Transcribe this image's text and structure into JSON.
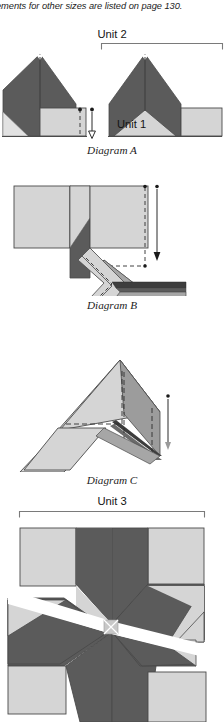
{
  "page": {
    "intro_text": "ements for other sizes are listed on page 130.",
    "background_color": "#ffffff"
  },
  "palette": {
    "dark_gray": "#5b5b5b",
    "medium_gray": "#a6a6a6",
    "light_gray": "#d5d5d5",
    "pale_gray": "#e2e2e2",
    "white": "#ffffff",
    "outline": "#4a4a4a",
    "rule": "#7a7a7a",
    "text": "#1c1c1c"
  },
  "labels": {
    "unit_1": "Unit 1",
    "unit_2": "Unit 2",
    "unit_3": "Unit 3"
  },
  "captions": {
    "diagram_a": "Diagram A",
    "diagram_b": "Diagram B",
    "diagram_c": "Diagram C"
  },
  "figures": [
    {
      "name": "diagram-a",
      "caption": "Diagram A",
      "top": 34,
      "height": 108,
      "description": "Two star-point units; left unit with light square folded over dark chevron and a downward press arrow, right unit labelled Unit 1 spanning bracket Unit 2",
      "has_bracket": true,
      "bracket_label": "Unit 2",
      "has_arrow": true,
      "arrow_direction": "down"
    },
    {
      "name": "diagram-b",
      "caption": "Diagram B",
      "top": 178,
      "height": 118,
      "description": "Angled unit with light square at left, dark diamond, dashed stitching lines and downward arrow at right",
      "has_bracket": false,
      "has_arrow": true,
      "arrow_direction": "down"
    },
    {
      "name": "diagram-c",
      "caption": "Diagram C",
      "top": 352,
      "height": 120,
      "description": "Rotated unit with dashed fold lines and a short downward arrow at right",
      "has_bracket": false,
      "has_arrow": true,
      "arrow_direction": "down"
    },
    {
      "name": "unit-3-block",
      "caption": "",
      "top": 512,
      "height": 210,
      "description": "Eight pointed LeMoyne star block with dark diamonds, light corner squares and side triangles, white diagonal seam through centre",
      "has_bracket": true,
      "bracket_label": "Unit 3",
      "has_arrow": false
    }
  ],
  "brackets": [
    {
      "name": "unit-2-bracket",
      "label": "Unit 2",
      "x1": 101,
      "x2": 222,
      "y": 44
    },
    {
      "name": "unit-3-bracket",
      "label": "Unit 3",
      "x1": 19,
      "x2": 205,
      "y": 512
    }
  ]
}
